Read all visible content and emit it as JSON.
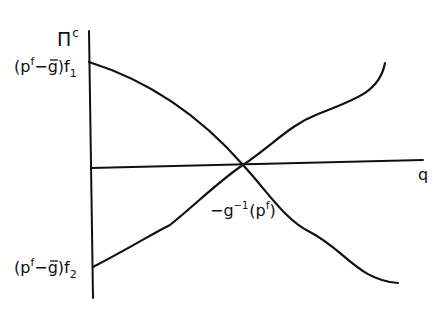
{
  "diagram": {
    "type": "economic-profit-diagram",
    "axes": {
      "y_label": {
        "base": "Π",
        "superscript": "c"
      },
      "x_label": "q"
    },
    "labels": {
      "top_intercept": {
        "open": "(p",
        "sup": "f",
        "mid": "−",
        "gbar": "g",
        "close": ")f",
        "sub": "1"
      },
      "bottom_intercept": {
        "open": "(p",
        "sup": "f",
        "mid": "−",
        "gbar": "g",
        "close": ")f",
        "sub": "2"
      },
      "crossing": {
        "prefix": "−g",
        "sup1": "−1",
        "open": "(p",
        "sup2": "f",
        "close": ")"
      }
    },
    "curves": [
      {
        "name": "descending-profit-curve",
        "from": "(p^f − ḡ)f_1",
        "to": "lower right"
      },
      {
        "name": "ascending-profit-curve",
        "from": "(p^f − ḡ)f_2",
        "to": "upper right"
      }
    ],
    "intersection": {
      "description": "curves cross on the q axis at −g⁻¹(p^f)"
    },
    "colors": {
      "ink": "#111111",
      "background": "#ffffff"
    }
  }
}
